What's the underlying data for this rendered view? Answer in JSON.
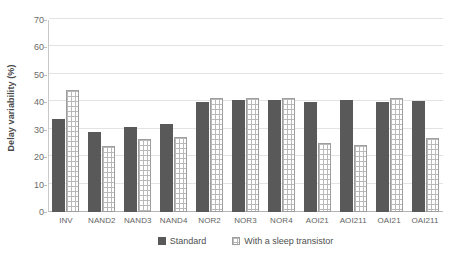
{
  "chart_data": {
    "type": "bar",
    "title": "",
    "xlabel": "",
    "ylabel": "Delay variability (%)",
    "ylim": [
      0,
      70
    ],
    "yticks": [
      0,
      10,
      20,
      30,
      40,
      50,
      60,
      70
    ],
    "grid": true,
    "legend_position": "bottom-center",
    "categories": [
      "INV",
      "NAND2",
      "NAND3",
      "NAND4",
      "NOR2",
      "NOR3",
      "NOR4",
      "AOI21",
      "AOI211",
      "OAI21",
      "OAI211"
    ],
    "series": [
      {
        "name": "Standard",
        "color": "#595959",
        "pattern": "solid",
        "values": [
          34,
          29,
          31,
          32,
          40,
          41,
          41,
          40,
          41,
          40,
          40.5
        ]
      },
      {
        "name": "With a sleep transistor",
        "color": "#ffffff",
        "pattern": "grid-hatch",
        "values": [
          44.5,
          24,
          26.5,
          27.5,
          41.5,
          41.5,
          41.5,
          25,
          24.5,
          41.5,
          27
        ]
      }
    ]
  },
  "legend": {
    "items": [
      {
        "label": "Standard",
        "swatch": "solid-dark"
      },
      {
        "label": "With a sleep transistor",
        "swatch": "grid-hatch"
      }
    ]
  }
}
